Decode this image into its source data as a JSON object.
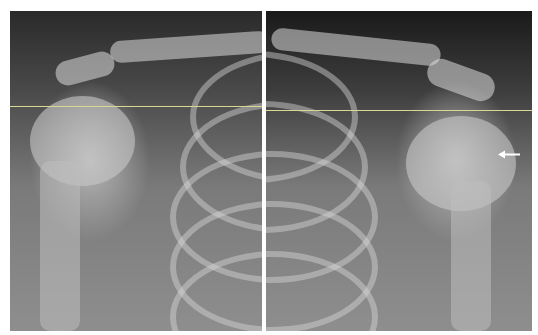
{
  "image": {
    "description": "Bilateral shoulder/chest radiograph composite, two panels separated by a white divider",
    "panels": [
      {
        "side": "left"
      },
      {
        "side": "right"
      }
    ],
    "annotations": {
      "reference_line_color": "#d8d890",
      "arrow": {
        "direction": "left",
        "color": "#ffffff"
      }
    }
  }
}
